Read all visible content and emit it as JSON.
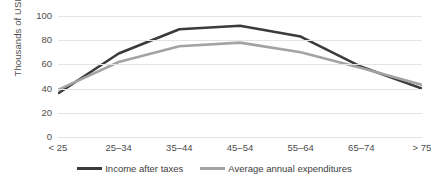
{
  "chart_data": {
    "type": "line",
    "title": "",
    "xlabel": "",
    "ylabel": "Thousands of USD",
    "categories": [
      "< 25",
      "25–34",
      "35–44",
      "45–54",
      "55–64",
      "65–74",
      "> 75"
    ],
    "series": [
      {
        "name": "Income after taxes",
        "color": "#3b3b3b",
        "values": [
          36,
          69,
          89,
          92,
          83,
          58,
          40
        ]
      },
      {
        "name": "Average annual expenditures",
        "color": "#a3a3a3",
        "values": [
          39,
          62,
          75,
          78,
          70,
          57,
          43
        ]
      }
    ],
    "ylim": [
      0,
      100
    ],
    "y_ticks": [
      0,
      20,
      40,
      60,
      80,
      100
    ],
    "y_tick_labels": [
      "0",
      "20",
      "40",
      "60",
      "80",
      "100"
    ],
    "grid": true,
    "legend_position": "bottom"
  },
  "axis": {
    "y_title": "Thousands of USD"
  },
  "colors": {
    "income_line": "#3b3b3b",
    "expenditures_line": "#a3a3a3",
    "gridline": "#e4e4e4",
    "text": "#4d4d4d",
    "background": "#ffffff"
  }
}
